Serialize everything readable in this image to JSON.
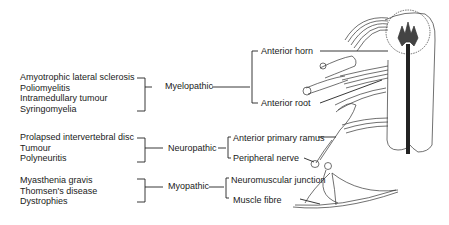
{
  "causes": {
    "myelopathic": [
      "Amyotrophic lateral sclerosis",
      "Poliomyelitis",
      "Intramedullary tumour",
      "Syringomyelia"
    ],
    "neuropathic": [
      "Prolapsed intervertebral disc",
      "Tumour",
      "Polyneuritis"
    ],
    "myopathic": [
      "Myasthenia gravis",
      "Thomsen's disease",
      "Dystrophies"
    ]
  },
  "categories": {
    "myelopathic": "Myelopathic",
    "neuropathic": "Neuropathic",
    "myopathic": "Myopathic"
  },
  "sites": {
    "myelopathic": [
      "Anterior horn",
      "Anterior root"
    ],
    "neuropathic": [
      "Anterior primary ramus",
      "Peripheral nerve"
    ],
    "myopathic": [
      "Neuromuscular junction",
      "Muscle fibre"
    ]
  },
  "illustration": {
    "subject": "spinal-cord-and-lower-motor-neuron"
  }
}
